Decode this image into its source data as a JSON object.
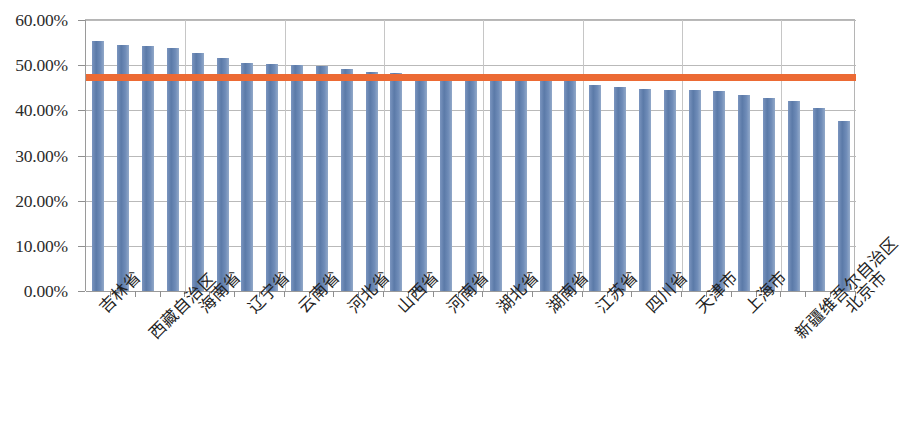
{
  "chart_data": {
    "type": "bar",
    "title": "",
    "subtitle": "",
    "xlabel": "",
    "ylabel": "",
    "ylim": [
      0,
      0.6
    ],
    "grid": true,
    "legend": "none",
    "y_tick_labels": [
      "0.00%",
      "10.00%",
      "20.00%",
      "30.00%",
      "40.00%",
      "50.00%",
      "60.00%"
    ],
    "y_tick_values": [
      0,
      10,
      20,
      30,
      40,
      50,
      60
    ],
    "categories": [
      "吉林省",
      "黑龙江省",
      "西藏自治区",
      "内蒙古自治区",
      "海南省",
      "青海省",
      "辽宁省",
      "贵州省",
      "云南省",
      "广西壮族自治区",
      "河北省",
      "甘肃省",
      "山西省",
      "宁夏回族自治区",
      "河南省",
      "安徽省",
      "湖北省",
      "江西省",
      "湖南省",
      "陕西省",
      "江苏省",
      "重庆市",
      "四川省",
      "山东省",
      "天津市",
      "福建省",
      "上海市",
      "浙江省",
      "新疆维吾尔自治区",
      "广东省",
      "北京市"
    ],
    "visible_tick_labels": [
      {
        "index": 0,
        "label": "吉林省",
        "row": 0
      },
      {
        "index": 2,
        "label": "西藏自治区",
        "row": 1
      },
      {
        "index": 4,
        "label": "海南省",
        "row": 0
      },
      {
        "index": 6,
        "label": "辽宁省",
        "row": 0
      },
      {
        "index": 8,
        "label": "云南省",
        "row": 0
      },
      {
        "index": 10,
        "label": "河北省",
        "row": 0
      },
      {
        "index": 12,
        "label": "山西省",
        "row": 0
      },
      {
        "index": 14,
        "label": "河南省",
        "row": 0
      },
      {
        "index": 16,
        "label": "湖北省",
        "row": 0
      },
      {
        "index": 18,
        "label": "湖南省",
        "row": 0
      },
      {
        "index": 20,
        "label": "江苏省",
        "row": 0
      },
      {
        "index": 22,
        "label": "四川省",
        "row": 0
      },
      {
        "index": 24,
        "label": "天津市",
        "row": 0
      },
      {
        "index": 26,
        "label": "上海市",
        "row": 0
      },
      {
        "index": 28,
        "label": "新疆维吾尔自治区",
        "row": 1
      },
      {
        "index": 30,
        "label": "北京市",
        "row": 0
      }
    ],
    "values": [
      55.3,
      54.5,
      54.2,
      53.8,
      52.7,
      51.7,
      50.4,
      50.2,
      50.0,
      49.9,
      49.2,
      48.6,
      48.2,
      47.8,
      47.5,
      47.3,
      47.1,
      47.0,
      46.9,
      46.8,
      45.7,
      45.2,
      44.7,
      44.5,
      44.5,
      44.3,
      43.4,
      42.7,
      42.0,
      40.5,
      37.7
    ],
    "reference_line": {
      "name": "average-line",
      "value": 47.3,
      "color": "#ec6a34"
    },
    "bar_color": "#5b7aa8"
  }
}
